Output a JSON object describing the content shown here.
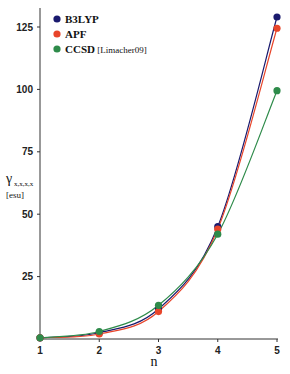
{
  "chart_data": {
    "type": "line",
    "title": "",
    "xlabel": "n",
    "ylabel": "γ_xxxx [esu]",
    "ylabel_main": "γ",
    "ylabel_sub": "x,x,x,x",
    "ylabel_unit": "[esu]",
    "x": [
      1,
      2,
      3,
      4,
      5
    ],
    "x_ticks": [
      "1",
      "2",
      "3",
      "4",
      "5"
    ],
    "y_ticks": [
      "25",
      "50",
      "75",
      "100",
      "125"
    ],
    "ylim": [
      0,
      130
    ],
    "xlim": [
      1,
      5
    ],
    "grid": false,
    "legend_position": "upper-left",
    "series": [
      {
        "name": "B3LYP",
        "color": "#1a1a6e",
        "values": [
          0.5,
          2.5,
          12,
          45,
          129
        ]
      },
      {
        "name": "APF",
        "color": "#e8452a",
        "values": [
          0.5,
          2,
          11,
          44,
          124.5
        ]
      },
      {
        "name": "CCSD",
        "name_suffix": "[Limacher09]",
        "color": "#2e8b4a",
        "values": [
          0.5,
          3,
          13.5,
          42,
          99.5
        ]
      }
    ]
  }
}
